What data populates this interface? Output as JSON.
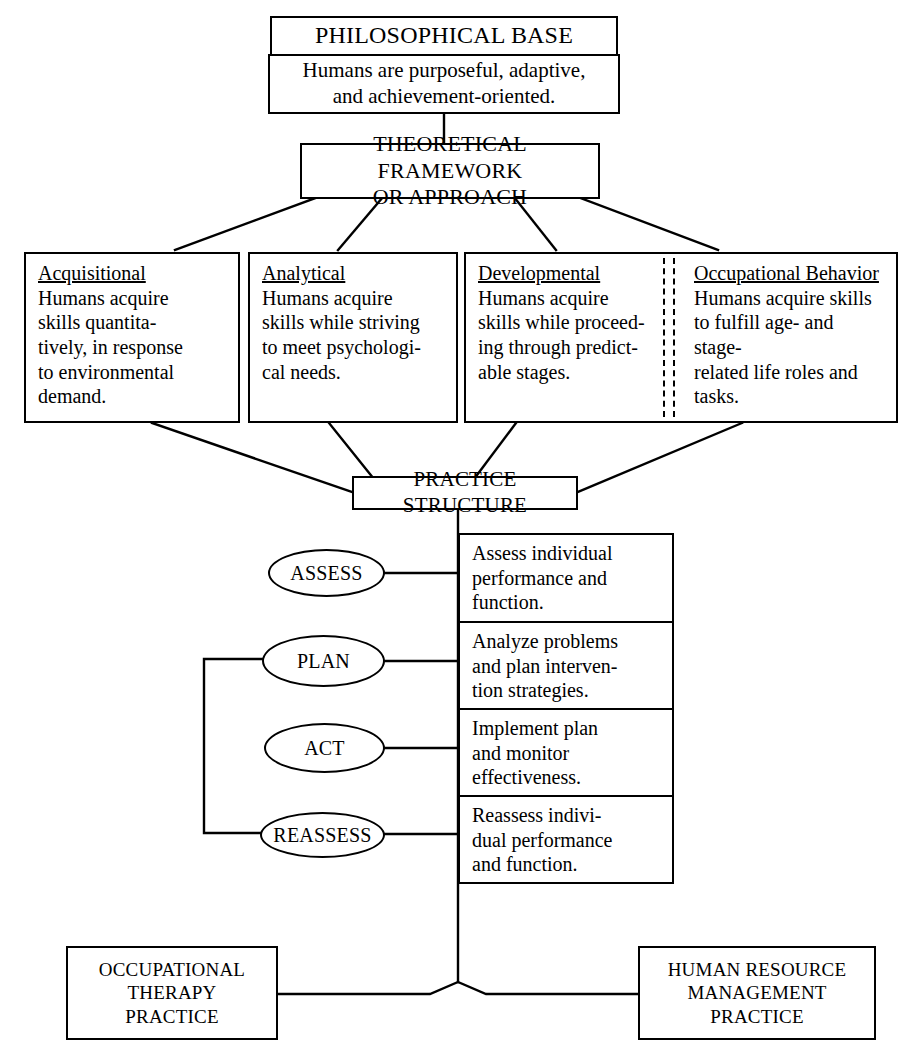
{
  "diagram": {
    "philosophical_base": {
      "header": "PHILOSOPHICAL BASE",
      "statement_line1": "Humans are purposeful, adaptive,",
      "statement_line2": "and achievement-oriented."
    },
    "theoretical_framework": {
      "line1": "THEORETICAL FRAMEWORK",
      "line2": "OR APPROACH"
    },
    "approaches": [
      {
        "name": "Acquisitional",
        "description": "Humans acquire skills quantita-tively, in response to environmental demand.",
        "lines": [
          "Humans acquire",
          "skills quantita-",
          "tively, in response",
          "to environmental",
          "demand."
        ]
      },
      {
        "name": "Analytical",
        "description": "Humans acquire skills while striving to meet psychological needs.",
        "lines": [
          "Humans acquire",
          "skills while striving",
          "to meet psychologi-",
          "cal needs."
        ]
      },
      {
        "name": "Developmental",
        "description": "Humans acquire skills while proceeding through predictable stages.",
        "lines": [
          "Humans acquire",
          "skills while proceed-",
          "ing through predict-",
          "able stages."
        ]
      },
      {
        "name": "Occupational Behavior",
        "description": "Humans acquire skills to fulfill age- and stage-related life roles and tasks.",
        "lines": [
          "Humans acquire skills",
          "to fulfill age- and stage-",
          "related life roles and",
          "tasks."
        ]
      }
    ],
    "practice_structure": {
      "label": "PRACTICE STRUCTURE"
    },
    "process_steps": [
      {
        "step": "ASSESS",
        "description": "Assess individual performance and function.",
        "lines": [
          "Assess individual",
          "performance and",
          "function."
        ]
      },
      {
        "step": "PLAN",
        "description": "Analyze problems and plan intervention strategies.",
        "lines": [
          "Analyze problems",
          "and plan interven-",
          "tion strategies."
        ]
      },
      {
        "step": "ACT",
        "description": "Implement plan and monitor effectiveness.",
        "lines": [
          "Implement plan",
          "and monitor",
          "effectiveness."
        ]
      },
      {
        "step": "REASSESS",
        "description": "Reassess individual performance and function.",
        "lines": [
          "Reassess indivi-",
          "dual performance",
          "and function."
        ]
      }
    ],
    "outcomes": [
      {
        "lines": [
          "OCCUPATIONAL",
          "THERAPY",
          "PRACTICE"
        ],
        "label": "OCCUPATIONAL THERAPY PRACTICE"
      },
      {
        "lines": [
          "HUMAN RESOURCE",
          "MANAGEMENT",
          "PRACTICE"
        ],
        "label": "HUMAN RESOURCE MANAGEMENT PRACTICE"
      }
    ],
    "colors": {
      "stroke": "#000000",
      "background": "#ffffff",
      "text": "#000000"
    }
  }
}
